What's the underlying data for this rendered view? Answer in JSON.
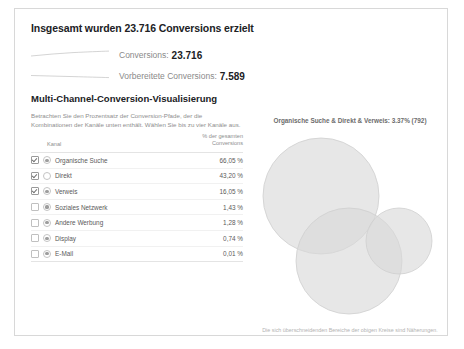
{
  "card": {
    "headline": "Insgesamt wurden 23.716 Conversions erzielt",
    "metrics": [
      {
        "label": "Conversions:",
        "value": "23.716",
        "icon": "sparkline-icon"
      },
      {
        "label": "Vorbereitete Conversions:",
        "value": "7.589",
        "icon": "sparkline-icon"
      }
    ],
    "section": {
      "title": "Multi-Channel-Conversion-Visualisierung",
      "description": "Betrachten Sie den Prozentsatz der Conversion-Pfade, der die Kombinationen der Kanäle unten enthält. Wählen Sie bis zu vier Kanäle aus."
    },
    "table": {
      "headers": {
        "channel": "Kanal",
        "percent_line1": "% der gesamten",
        "percent_line2": "Conversions"
      },
      "rows": [
        {
          "name": "Organische Suche",
          "percent": "66,05 %",
          "selected": true,
          "marked": true
        },
        {
          "name": "Direkt",
          "percent": "43,20 %",
          "selected": true,
          "marked": false
        },
        {
          "name": "Verweis",
          "percent": "16,05 %",
          "selected": true,
          "marked": true
        },
        {
          "name": "Soziales Netzwerk",
          "percent": "1,43 %",
          "selected": false,
          "marked": true
        },
        {
          "name": "Andere Werbung",
          "percent": "1,28 %",
          "selected": false,
          "marked": true
        },
        {
          "name": "Display",
          "percent": "0,74 %",
          "selected": false,
          "marked": true
        },
        {
          "name": "E-Mail",
          "percent": "0,01 %",
          "selected": false,
          "marked": true
        }
      ]
    },
    "venn": {
      "title": "Organische Suche & Direkt & Verweis: 3.37% (792)",
      "note": "Die sich überschneidenden Bereiche der obigen Kreise sind Näherungen.",
      "circle_fill": "#d9d9d9",
      "circle_stroke": "#cfcfcf",
      "circles": [
        {
          "label": "Organische Suche",
          "cx": 70,
          "cy": 65,
          "r": 58
        },
        {
          "label": "Direkt",
          "cx": 98,
          "cy": 130,
          "r": 53
        },
        {
          "label": "Verweis",
          "cx": 148,
          "cy": 110,
          "r": 33
        }
      ]
    }
  }
}
